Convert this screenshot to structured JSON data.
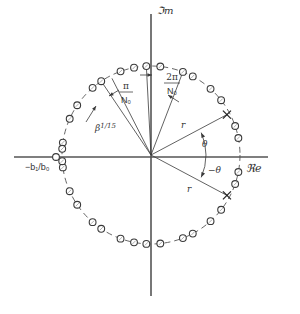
{
  "diagram": {
    "type": "pole-zero-plot",
    "center": [
      151,
      155
    ],
    "radius": 89,
    "colors": {
      "ink": "#3a3a3a",
      "axis": "#555555",
      "background": "#ffffff"
    },
    "axes": {
      "imag_label": "ℑm",
      "real_label": "ℜe"
    },
    "labels": {
      "pi_over_n0_num": "π",
      "pi_over_n0_den": "N₀",
      "two_pi_over_n0_num": "2π",
      "two_pi_over_n0_den": "N₀",
      "beta": "β",
      "beta_exp": "1/15",
      "r_upper": "r",
      "r_lower": "r",
      "theta": "θ",
      "neg_theta": "−θ",
      "real_zero": "−b₁/b₀"
    },
    "poles_deg": [
      28,
      -28
    ],
    "zeros_deg": [
      93,
      84,
      69,
      62,
      48,
      38,
      19,
      11,
      -11,
      -19,
      -38,
      -48,
      -62,
      -69,
      -84,
      -93,
      101,
      110,
      124,
      131,
      146,
      156,
      172,
      188,
      204,
      214,
      229,
      236,
      250,
      259,
      176,
      184
    ],
    "real_zero_offset": -10,
    "rays_deg": {
      "pi_over_n0_a": 117,
      "pi_over_n0_b": 124,
      "two_pi_left": 93,
      "two_pi_right": 69
    }
  }
}
